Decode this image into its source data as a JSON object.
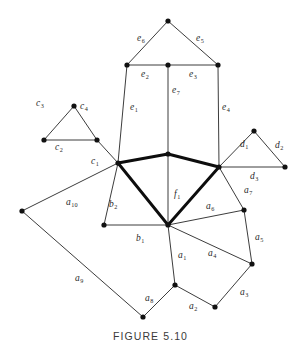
{
  "figure": {
    "caption": "FIGURE 5.10",
    "width": 301,
    "height": 356,
    "background": "#ffffff",
    "edge_color_thin": "#262626",
    "edge_color_thick": "#0d0d0d",
    "vertex_color": "#111111"
  },
  "chart_data": {
    "type": "diagram",
    "title": "FIGURE 5.10",
    "subtitle": "",
    "xlabel": "",
    "ylabel": "",
    "grid": false,
    "legend": "none",
    "vertices": [
      {
        "id": "v_apex",
        "x": 168,
        "y": 21
      },
      {
        "id": "v_top_left",
        "x": 127,
        "y": 65
      },
      {
        "id": "v_top_mid",
        "x": 168,
        "y": 65
      },
      {
        "id": "v_top_right",
        "x": 218,
        "y": 65
      },
      {
        "id": "v_left_hub",
        "x": 118,
        "y": 163
      },
      {
        "id": "v_right_hub",
        "x": 219,
        "y": 167
      },
      {
        "id": "v_center_hub",
        "x": 168,
        "y": 225
      },
      {
        "id": "v_diamond_top",
        "x": 168,
        "y": 154
      },
      {
        "id": "v_c_left",
        "x": 44,
        "y": 140
      },
      {
        "id": "v_c_apex",
        "x": 74,
        "y": 106
      },
      {
        "id": "v_c_right",
        "x": 97,
        "y": 140
      },
      {
        "id": "v_d_apex",
        "x": 254,
        "y": 131
      },
      {
        "id": "v_d_right",
        "x": 285,
        "y": 167
      },
      {
        "id": "v_b_left",
        "x": 104,
        "y": 225
      },
      {
        "id": "v_far_left",
        "x": 22,
        "y": 211
      },
      {
        "id": "v_bottom_left",
        "x": 143,
        "y": 317
      },
      {
        "id": "v_bottom_mid",
        "x": 175,
        "y": 285
      },
      {
        "id": "v_bottom_right",
        "x": 215,
        "y": 307
      },
      {
        "id": "v_right_low",
        "x": 252,
        "y": 264
      },
      {
        "id": "v_right_mid",
        "x": 244,
        "y": 210
      }
    ],
    "edges": [
      {
        "label": "e6",
        "from": "v_top_left",
        "to": "v_apex",
        "weight": "thin"
      },
      {
        "label": "e5",
        "from": "v_apex",
        "to": "v_top_right",
        "weight": "thin"
      },
      {
        "label": "e2",
        "from": "v_top_left",
        "to": "v_top_mid",
        "weight": "thin"
      },
      {
        "label": "e3",
        "from": "v_top_mid",
        "to": "v_top_right",
        "weight": "thin"
      },
      {
        "label": "e1",
        "from": "v_top_left",
        "to": "v_left_hub",
        "weight": "thin"
      },
      {
        "label": "e7",
        "from": "v_top_mid",
        "to": "v_center_hub",
        "weight": "thin"
      },
      {
        "label": "e4",
        "from": "v_top_right",
        "to": "v_right_hub",
        "weight": "thin"
      },
      {
        "label": "f1",
        "from": "v_left_hub",
        "to": "v_diamond_top",
        "weight": "thick"
      },
      {
        "label": "f1",
        "from": "v_diamond_top",
        "to": "v_right_hub",
        "weight": "thick"
      },
      {
        "label": "f1",
        "from": "v_left_hub",
        "to": "v_center_hub",
        "weight": "thick"
      },
      {
        "label": "f1",
        "from": "v_center_hub",
        "to": "v_right_hub",
        "weight": "thick"
      },
      {
        "label": "c3",
        "from": "v_c_left",
        "to": "v_c_apex",
        "weight": "thin"
      },
      {
        "label": "c4",
        "from": "v_c_apex",
        "to": "v_c_right",
        "weight": "thin"
      },
      {
        "label": "c2",
        "from": "v_c_left",
        "to": "v_c_right",
        "weight": "thin"
      },
      {
        "label": "c1",
        "from": "v_c_right",
        "to": "v_left_hub",
        "weight": "thin"
      },
      {
        "label": "d1",
        "from": "v_right_hub",
        "to": "v_d_apex",
        "weight": "thin"
      },
      {
        "label": "d2",
        "from": "v_d_apex",
        "to": "v_d_right",
        "weight": "thin"
      },
      {
        "label": "d3",
        "from": "v_right_hub",
        "to": "v_d_right",
        "weight": "thin"
      },
      {
        "label": "b2",
        "from": "v_left_hub",
        "to": "v_b_left",
        "weight": "thin"
      },
      {
        "label": "b1",
        "from": "v_b_left",
        "to": "v_center_hub",
        "weight": "thin"
      },
      {
        "label": "a10",
        "from": "v_left_hub",
        "to": "v_far_left",
        "weight": "thin"
      },
      {
        "label": "a9",
        "from": "v_far_left",
        "to": "v_bottom_left",
        "weight": "thin"
      },
      {
        "label": "a8",
        "from": "v_bottom_left",
        "to": "v_bottom_mid",
        "weight": "thin"
      },
      {
        "label": "a1",
        "from": "v_center_hub",
        "to": "v_bottom_mid",
        "weight": "thin"
      },
      {
        "label": "a2",
        "from": "v_bottom_mid",
        "to": "v_bottom_right",
        "weight": "thin"
      },
      {
        "label": "a3",
        "from": "v_bottom_right",
        "to": "v_right_low",
        "weight": "thin"
      },
      {
        "label": "a4",
        "from": "v_center_hub",
        "to": "v_right_low",
        "weight": "thin"
      },
      {
        "label": "a5",
        "from": "v_right_low",
        "to": "v_right_mid",
        "weight": "thin"
      },
      {
        "label": "a6",
        "from": "v_center_hub",
        "to": "v_right_mid",
        "weight": "thin"
      },
      {
        "label": "a7",
        "from": "v_right_mid",
        "to": "v_right_hub",
        "weight": "thin"
      }
    ]
  },
  "labels": [
    {
      "name": "edge-label-e6",
      "base": "e",
      "sub": "6",
      "x": 137,
      "y": 34
    },
    {
      "name": "edge-label-e5",
      "base": "e",
      "sub": "5",
      "x": 196,
      "y": 34
    },
    {
      "name": "edge-label-e2",
      "base": "e",
      "sub": "2",
      "x": 141,
      "y": 70
    },
    {
      "name": "edge-label-e3",
      "base": "e",
      "sub": "3",
      "x": 189,
      "y": 70
    },
    {
      "name": "edge-label-e7",
      "base": "e",
      "sub": "7",
      "x": 172,
      "y": 86
    },
    {
      "name": "edge-label-e1",
      "base": "e",
      "sub": "1",
      "x": 130,
      "y": 103
    },
    {
      "name": "edge-label-e4",
      "base": "e",
      "sub": "4",
      "x": 222,
      "y": 103
    },
    {
      "name": "edge-label-c3",
      "base": "c",
      "sub": "3",
      "x": 36,
      "y": 99
    },
    {
      "name": "edge-label-c4",
      "base": "c",
      "sub": "4",
      "x": 80,
      "y": 102
    },
    {
      "name": "edge-label-c2",
      "base": "c",
      "sub": "2",
      "x": 55,
      "y": 143
    },
    {
      "name": "edge-label-c1",
      "base": "c",
      "sub": "1",
      "x": 91,
      "y": 157
    },
    {
      "name": "edge-label-d1",
      "base": "d",
      "sub": "1",
      "x": 240,
      "y": 140
    },
    {
      "name": "edge-label-d2",
      "base": "d",
      "sub": "2",
      "x": 275,
      "y": 141
    },
    {
      "name": "edge-label-d3",
      "base": "d",
      "sub": "3",
      "x": 250,
      "y": 172
    },
    {
      "name": "face-label-f1",
      "base": "f",
      "sub": "1",
      "x": 174,
      "y": 190
    },
    {
      "name": "edge-label-b2",
      "base": "b",
      "sub": "2",
      "x": 109,
      "y": 200
    },
    {
      "name": "edge-label-b1",
      "base": "b",
      "sub": "1",
      "x": 136,
      "y": 234
    },
    {
      "name": "edge-label-a10",
      "base": "a",
      "sub": "10",
      "x": 66,
      "y": 198
    },
    {
      "name": "edge-label-a9",
      "base": "a",
      "sub": "9",
      "x": 75,
      "y": 274
    },
    {
      "name": "edge-label-a8",
      "base": "a",
      "sub": "8",
      "x": 145,
      "y": 294
    },
    {
      "name": "edge-label-a1",
      "base": "a",
      "sub": "1",
      "x": 178,
      "y": 251
    },
    {
      "name": "edge-label-a2",
      "base": "a",
      "sub": "2",
      "x": 189,
      "y": 302
    },
    {
      "name": "edge-label-a3",
      "base": "a",
      "sub": "3",
      "x": 240,
      "y": 288
    },
    {
      "name": "edge-label-a4",
      "base": "a",
      "sub": "4",
      "x": 208,
      "y": 249
    },
    {
      "name": "edge-label-a5",
      "base": "a",
      "sub": "5",
      "x": 255,
      "y": 233
    },
    {
      "name": "edge-label-a6",
      "base": "a",
      "sub": "6",
      "x": 206,
      "y": 202
    },
    {
      "name": "edge-label-a7",
      "base": "a",
      "sub": "7",
      "x": 244,
      "y": 186
    }
  ]
}
